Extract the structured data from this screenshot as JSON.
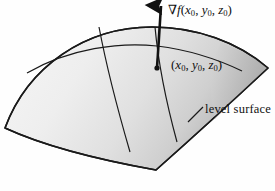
{
  "figure": {
    "background_color": "#fefefe",
    "ink_color": "#111111",
    "surface_fill_light": "#f2f2f2",
    "surface_fill_dark": "#b9b9b9",
    "labels": {
      "gradient": {
        "nabla": "∇",
        "function": "f",
        "open_paren": "(",
        "x": "x",
        "x_sub": "0",
        "comma_1": ", ",
        "y": "y",
        "y_sub": "0",
        "comma_2": ", ",
        "z": "z",
        "z_sub": "0",
        "close_paren": ")"
      },
      "point": {
        "open_paren": "(",
        "x": "x",
        "x_sub": "0",
        "comma_1": ", ",
        "y": "y",
        "y_sub": "0",
        "comma_2": ", ",
        "z": "z",
        "z_sub": "0",
        "close_paren": ")"
      },
      "level_surface": "level surface"
    },
    "icons": {
      "gradient_arrow": "up-arrow-icon",
      "point_marker": "point-dot-icon"
    }
  }
}
